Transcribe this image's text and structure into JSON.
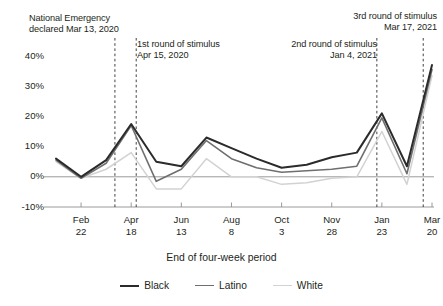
{
  "chart_data": {
    "type": "line",
    "title": "",
    "xlabel": "End of four-week period",
    "ylabel": "",
    "ylim": [
      -10,
      40
    ],
    "yticks": [
      -10,
      0,
      10,
      20,
      30,
      40
    ],
    "ytick_labels": [
      "-10%",
      "0%",
      "10%",
      "20%",
      "30%",
      "40%"
    ],
    "grid": false,
    "legend_position": "bottom",
    "x_tick_labels": [
      "Feb\n22",
      "Apr\n18",
      "Jun\n13",
      "Aug\n8",
      "Oct\n3",
      "Nov\n28",
      "Jan\n23",
      "Mar\n20"
    ],
    "x_tick_indices": [
      1,
      3,
      5,
      7,
      9,
      11,
      13,
      15
    ],
    "x": [
      0,
      1,
      2,
      3,
      4,
      5,
      6,
      7,
      8,
      9,
      10,
      11,
      12,
      13,
      14,
      15
    ],
    "series": [
      {
        "name": "Black",
        "color": "#2b2b2b",
        "values": [
          6.0,
          0.0,
          5.5,
          17.5,
          5.0,
          3.5,
          13.0,
          9.5,
          6.0,
          3.0,
          4.0,
          6.5,
          8.0,
          21.0,
          3.5,
          37.0
        ]
      },
      {
        "name": "Latino",
        "color": "#6f6f6f",
        "values": [
          5.5,
          -0.5,
          4.5,
          17.0,
          -1.5,
          2.5,
          12.0,
          6.0,
          3.0,
          1.5,
          2.0,
          2.5,
          3.5,
          19.5,
          1.0,
          35.5
        ]
      },
      {
        "name": "White",
        "color": "#d2d2d2",
        "values": [
          5.0,
          -0.5,
          2.5,
          8.0,
          -4.0,
          -4.0,
          6.0,
          0.0,
          0.0,
          -2.5,
          -2.0,
          -0.5,
          0.0,
          15.0,
          -2.5,
          33.5
        ]
      }
    ],
    "annotations": [
      {
        "name": "national-emergency",
        "line1": "National Emergency",
        "line2": "declared Mar 13, 2020",
        "x_index": 2.35,
        "align": "left"
      },
      {
        "name": "first-stimulus",
        "line1": "1st round of stimulus",
        "line2": "Apr 15, 2020",
        "x_index": 3.2,
        "align": "left"
      },
      {
        "name": "second-stimulus",
        "line1": "2nd round of stimulus",
        "line2": "Jan 4, 2021",
        "x_index": 12.8,
        "align": "right"
      },
      {
        "name": "third-stimulus",
        "line1": "3rd round of stimulus",
        "line2": "Mar 17, 2021",
        "x_index": 14.65,
        "align": "right"
      }
    ]
  },
  "axis": {
    "y_labels": [
      "40%",
      "30%",
      "20%",
      "10%",
      "0%",
      "-10%"
    ],
    "x_labels": [
      "Feb\n22",
      "Apr\n18",
      "Jun\n13",
      "Aug\n8",
      "Oct\n3",
      "Nov\n28",
      "Jan\n23",
      "Mar\n20"
    ],
    "x_title": "End of four-week period"
  },
  "annotations": {
    "national_emergency": "National Emergency\ndeclared Mar 13, 2020",
    "stimulus_1": "1st round of stimulus\nApr 15, 2020",
    "stimulus_2": "2nd round of stimulus\nJan 4, 2021",
    "stimulus_3": "3rd round of stimulus\nMar 17, 2021"
  },
  "legend": {
    "items": [
      {
        "label": "Black",
        "color": "#2b2b2b"
      },
      {
        "label": "Latino",
        "color": "#6f6f6f"
      },
      {
        "label": "White",
        "color": "#d2d2d2"
      }
    ]
  }
}
